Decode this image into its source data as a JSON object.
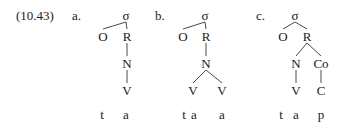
{
  "example": {
    "number": "(10.43)",
    "number_pos": [
      16,
      15
    ]
  },
  "trees": [
    {
      "label": "a.",
      "label_pos": [
        72,
        15
      ],
      "nodes": [
        {
          "id": "sigma",
          "text": "σ",
          "x": 126,
          "y": 15
        },
        {
          "id": "O",
          "text": "O",
          "x": 103,
          "y": 36
        },
        {
          "id": "R",
          "text": "R",
          "x": 127,
          "y": 36
        },
        {
          "id": "N",
          "text": "N",
          "x": 127,
          "y": 63
        },
        {
          "id": "V",
          "text": "V",
          "x": 127,
          "y": 90
        }
      ],
      "edges": [
        [
          "sigma",
          "O"
        ],
        [
          "sigma",
          "R"
        ],
        [
          "R",
          "N"
        ],
        [
          "N",
          "V"
        ]
      ],
      "segments": [
        {
          "text": "t",
          "x": 102,
          "y": 114
        },
        {
          "text": "a",
          "x": 126,
          "y": 114
        }
      ]
    },
    {
      "label": "b.",
      "label_pos": [
        155,
        15
      ],
      "nodes": [
        {
          "id": "sigma",
          "text": "σ",
          "x": 205,
          "y": 15
        },
        {
          "id": "O",
          "text": "O",
          "x": 183,
          "y": 36
        },
        {
          "id": "R",
          "text": "R",
          "x": 206,
          "y": 36
        },
        {
          "id": "N",
          "text": "N",
          "x": 206,
          "y": 63
        },
        {
          "id": "V1",
          "text": "V",
          "x": 193,
          "y": 90
        },
        {
          "id": "V2",
          "text": "V",
          "x": 222,
          "y": 90
        }
      ],
      "edges": [
        [
          "sigma",
          "O"
        ],
        [
          "sigma",
          "R"
        ],
        [
          "R",
          "N"
        ],
        [
          "N",
          "V1"
        ],
        [
          "N",
          "V2"
        ]
      ],
      "segments": [
        {
          "text": "t",
          "x": 184,
          "y": 114
        },
        {
          "text": "a",
          "x": 194,
          "y": 114
        },
        {
          "text": "a",
          "x": 222,
          "y": 114
        }
      ]
    },
    {
      "label": "c.",
      "label_pos": [
        256,
        15
      ],
      "nodes": [
        {
          "id": "sigma",
          "text": "σ",
          "x": 295,
          "y": 15
        },
        {
          "id": "O",
          "text": "O",
          "x": 283,
          "y": 36
        },
        {
          "id": "R",
          "text": "R",
          "x": 307,
          "y": 36
        },
        {
          "id": "N",
          "text": "N",
          "x": 296,
          "y": 63
        },
        {
          "id": "Co",
          "text": "Co",
          "x": 321,
          "y": 63
        },
        {
          "id": "V",
          "text": "V",
          "x": 296,
          "y": 90
        },
        {
          "id": "C",
          "text": "C",
          "x": 321,
          "y": 90
        }
      ],
      "edges": [
        [
          "sigma",
          "O"
        ],
        [
          "sigma",
          "R"
        ],
        [
          "R",
          "N"
        ],
        [
          "R",
          "Co"
        ],
        [
          "N",
          "V"
        ],
        [
          "Co",
          "C"
        ]
      ],
      "segments": [
        {
          "text": "t",
          "x": 281,
          "y": 114
        },
        {
          "text": "a",
          "x": 296,
          "y": 114
        },
        {
          "text": "p",
          "x": 321,
          "y": 114
        }
      ]
    }
  ]
}
